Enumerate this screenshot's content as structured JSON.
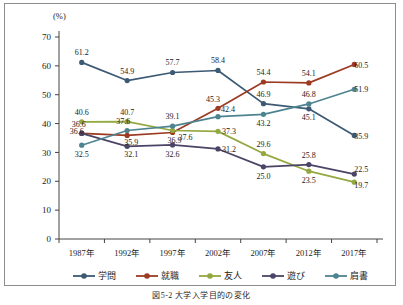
{
  "caption": "図5-2 大学入学目的の変化",
  "chart_data": {
    "type": "line",
    "title": "",
    "subtitle": "",
    "xlabel": "",
    "ylabel": "",
    "unit_label": "(%)",
    "grid": false,
    "legend_position": "bottom",
    "categories": [
      "1987年",
      "1992年",
      "1997年",
      "2002年",
      "2007年",
      "2012年",
      "2017年"
    ],
    "ylim": [
      0,
      70
    ],
    "yticks": [
      0,
      10,
      20,
      30,
      40,
      50,
      60,
      70
    ],
    "ytick_labels": [
      "0",
      "10",
      "20",
      "30",
      "40",
      "50",
      "60",
      "70"
    ],
    "series": [
      {
        "name": "学問",
        "color": "#3d5a75",
        "values": [
          61.2,
          54.9,
          57.7,
          58.4,
          46.9,
          45.1,
          35.9
        ],
        "labels": [
          "61.2",
          "54.9",
          "57.7",
          "58.4",
          "46.9",
          "45.1",
          "35.9"
        ]
      },
      {
        "name": "就職",
        "color": "#9c3a22",
        "values": [
          36.6,
          35.9,
          36.9,
          45.3,
          54.4,
          54.1,
          60.5
        ],
        "labels": [
          "36.6",
          "35.9",
          "36.9",
          "45.3",
          "54.4",
          "54.1",
          "60.5"
        ]
      },
      {
        "name": "友人",
        "color": "#93a83f",
        "values": [
          40.6,
          40.7,
          37.6,
          37.3,
          29.6,
          23.5,
          19.7
        ],
        "labels": [
          "40.6",
          "40.7",
          "37.6",
          "37.3",
          "29.6",
          "23.5",
          "19.7"
        ]
      },
      {
        "name": "遊び",
        "color": "#4b4466",
        "values": [
          36.6,
          32.1,
          32.6,
          31.2,
          25.0,
          25.8,
          22.5
        ],
        "labels": [
          "36.6",
          "32.1",
          "32.6",
          "31.2",
          "25.0",
          "25.8",
          "22.5"
        ]
      },
      {
        "name": "肩書",
        "color": "#4e8390",
        "values": [
          32.5,
          37.6,
          39.1,
          42.4,
          43.2,
          46.8,
          51.9
        ],
        "labels": [
          "32.5",
          "37.6",
          "39.1",
          "42.4",
          "43.2",
          "46.8",
          "51.9"
        ]
      }
    ],
    "label_offsets": [
      {
        "series": 0,
        "dx": 0,
        "dy": -7,
        "anchor": "middle"
      },
      {
        "series": 0,
        "dx": 0,
        "dy": -7,
        "anchor": "middle"
      },
      {
        "series": 0,
        "dx": 0,
        "dy": -7,
        "anchor": "middle"
      },
      {
        "series": 0,
        "dx": 0,
        "dy": -7,
        "anchor": "middle"
      },
      {
        "series": 0,
        "dx": 0,
        "dy": -7,
        "anchor": "middle"
      },
      {
        "series": 0,
        "dx": 0,
        "dy": 11,
        "anchor": "middle"
      },
      {
        "series": 0,
        "dx": 7,
        "dy": 4,
        "anchor": "start"
      },
      {
        "series": 1,
        "dx": -3,
        "dy": -6,
        "anchor": "end"
      },
      {
        "series": 1,
        "dx": 4,
        "dy": 10,
        "anchor": "middle"
      },
      {
        "series": 1,
        "dx": 2,
        "dy": 10,
        "anchor": "middle"
      },
      {
        "series": 1,
        "dx": -5,
        "dy": -6,
        "anchor": "end"
      },
      {
        "series": 1,
        "dx": 0,
        "dy": -7,
        "anchor": "middle"
      },
      {
        "series": 1,
        "dx": 0,
        "dy": -7,
        "anchor": "middle"
      },
      {
        "series": 1,
        "dx": 7,
        "dy": 4,
        "anchor": "start"
      },
      {
        "series": 2,
        "dx": 0,
        "dy": -7,
        "anchor": "middle"
      },
      {
        "series": 2,
        "dx": 0,
        "dy": -7,
        "anchor": "middle"
      },
      {
        "series": 2,
        "dx": 13,
        "dy": 10,
        "anchor": "middle"
      },
      {
        "series": 2,
        "dx": 11,
        "dy": 3,
        "anchor": "start"
      },
      {
        "series": 2,
        "dx": 0,
        "dy": -7,
        "anchor": "middle"
      },
      {
        "series": 2,
        "dx": 0,
        "dy": 12,
        "anchor": "middle"
      },
      {
        "series": 2,
        "dx": 7,
        "dy": 6,
        "anchor": "start"
      },
      {
        "series": 3,
        "dx": -5,
        "dy": 1,
        "anchor": "end"
      },
      {
        "series": 3,
        "dx": 4,
        "dy": 11,
        "anchor": "middle"
      },
      {
        "series": 3,
        "dx": 0,
        "dy": 12,
        "anchor": "middle"
      },
      {
        "series": 3,
        "dx": 11,
        "dy": 3,
        "anchor": "start"
      },
      {
        "series": 3,
        "dx": 0,
        "dy": 12,
        "anchor": "middle"
      },
      {
        "series": 3,
        "dx": 0,
        "dy": -7,
        "anchor": "middle"
      },
      {
        "series": 3,
        "dx": 7,
        "dy": -2,
        "anchor": "start"
      },
      {
        "series": 4,
        "dx": 0,
        "dy": 12,
        "anchor": "middle"
      },
      {
        "series": 4,
        "dx": -4,
        "dy": -6,
        "anchor": "end"
      },
      {
        "series": 4,
        "dx": 0,
        "dy": -7,
        "anchor": "middle"
      },
      {
        "series": 4,
        "dx": 10,
        "dy": -5,
        "anchor": "start"
      },
      {
        "series": 4,
        "dx": 0,
        "dy": 12,
        "anchor": "middle"
      },
      {
        "series": 4,
        "dx": 0,
        "dy": -7,
        "anchor": "middle"
      },
      {
        "series": 4,
        "dx": 7,
        "dy": 3,
        "anchor": "start"
      }
    ]
  }
}
